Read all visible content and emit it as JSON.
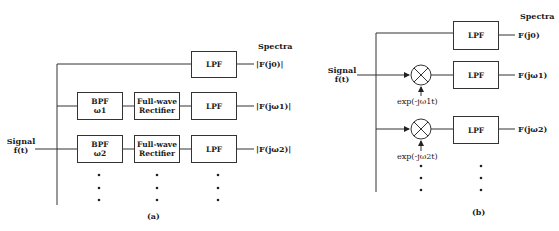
{
  "diagram_a": {
    "caption": "(a)",
    "input_label_1": "Signal",
    "input_label_2": "f(t)",
    "spectra_heading": "Spectra",
    "rows": [
      {
        "blocks": [
          {
            "name": "LPF"
          }
        ],
        "output": "|F(j0)|"
      },
      {
        "blocks": [
          {
            "name": "BPF",
            "sub": "ω1"
          },
          {
            "name": "Full-wave",
            "sub": "Rectifier"
          },
          {
            "name": "LPF"
          }
        ],
        "output": "|F(jω1)|"
      },
      {
        "blocks": [
          {
            "name": "BPF",
            "sub": "ω2"
          },
          {
            "name": "Full-wave",
            "sub": "Rectifier"
          },
          {
            "name": "LPF"
          }
        ],
        "output": "|F(jω2)|"
      }
    ],
    "continuation": "⋮"
  },
  "diagram_b": {
    "caption": "(b)",
    "input_label_1": "Signal",
    "input_label_2": "f(t)",
    "spectra_heading": "Spectra",
    "rows": [
      {
        "mixer": null,
        "block": "LPF",
        "output": "F(j0)"
      },
      {
        "mixer": "exp(-jω1t)",
        "block": "LPF",
        "output": "F(jω1)"
      },
      {
        "mixer": "exp(-jω2t)",
        "block": "LPF",
        "output": "F(jω2)"
      }
    ],
    "continuation": "⋮"
  }
}
